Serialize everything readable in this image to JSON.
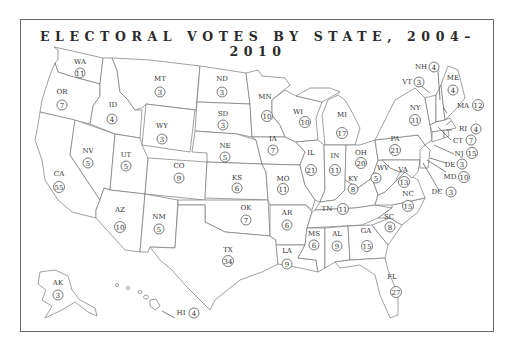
{
  "title": "ELECTORAL VOTES BY STATE, 2004–2010",
  "map": {
    "type": "choropleth-outline",
    "region": "United States",
    "period": "2004–2010"
  },
  "states": [
    {
      "abbr": "WA",
      "votes": "11"
    },
    {
      "abbr": "OR",
      "votes": "7"
    },
    {
      "abbr": "CA",
      "votes": "55"
    },
    {
      "abbr": "ID",
      "votes": "4"
    },
    {
      "abbr": "NV",
      "votes": "5"
    },
    {
      "abbr": "MT",
      "votes": "3"
    },
    {
      "abbr": "WY",
      "votes": "3"
    },
    {
      "abbr": "UT",
      "votes": "5"
    },
    {
      "abbr": "AZ",
      "votes": "10"
    },
    {
      "abbr": "CO",
      "votes": "9"
    },
    {
      "abbr": "NM",
      "votes": "5"
    },
    {
      "abbr": "ND",
      "votes": "3"
    },
    {
      "abbr": "SD",
      "votes": "3"
    },
    {
      "abbr": "NE",
      "votes": "5"
    },
    {
      "abbr": "KS",
      "votes": "6"
    },
    {
      "abbr": "OK",
      "votes": "7"
    },
    {
      "abbr": "TX",
      "votes": "34"
    },
    {
      "abbr": "MN",
      "votes": "10"
    },
    {
      "abbr": "IA",
      "votes": "7"
    },
    {
      "abbr": "MO",
      "votes": "11"
    },
    {
      "abbr": "AR",
      "votes": "6"
    },
    {
      "abbr": "LA",
      "votes": "9"
    },
    {
      "abbr": "WI",
      "votes": "10"
    },
    {
      "abbr": "IL",
      "votes": "21"
    },
    {
      "abbr": "MI",
      "votes": "17"
    },
    {
      "abbr": "IN",
      "votes": "11"
    },
    {
      "abbr": "OH",
      "votes": "20"
    },
    {
      "abbr": "KY",
      "votes": "8"
    },
    {
      "abbr": "TN",
      "votes": "11"
    },
    {
      "abbr": "MS",
      "votes": "6"
    },
    {
      "abbr": "AL",
      "votes": "9"
    },
    {
      "abbr": "GA",
      "votes": "15"
    },
    {
      "abbr": "FL",
      "votes": "27"
    },
    {
      "abbr": "SC",
      "votes": "8"
    },
    {
      "abbr": "NC",
      "votes": "15"
    },
    {
      "abbr": "VA",
      "votes": "13"
    },
    {
      "abbr": "WV",
      "votes": "5"
    },
    {
      "abbr": "PA",
      "votes": "21"
    },
    {
      "abbr": "NY",
      "votes": "31"
    },
    {
      "abbr": "VT",
      "votes": "3"
    },
    {
      "abbr": "NH",
      "votes": "4"
    },
    {
      "abbr": "ME",
      "votes": "4"
    },
    {
      "abbr": "MA",
      "votes": "12"
    },
    {
      "abbr": "RI",
      "votes": "4"
    },
    {
      "abbr": "CT",
      "votes": "7"
    },
    {
      "abbr": "NJ",
      "votes": "15"
    },
    {
      "abbr": "DE",
      "votes": "3"
    },
    {
      "abbr": "MD",
      "votes": "10"
    },
    {
      "abbr": "DC",
      "votes": "3"
    },
    {
      "abbr": "AK",
      "votes": "3"
    },
    {
      "abbr": "HI",
      "votes": "4"
    }
  ]
}
